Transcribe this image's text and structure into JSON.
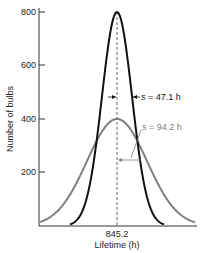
{
  "chart_data": {
    "type": "line",
    "title": "",
    "xlabel": "Lifetime (h)",
    "ylabel": "Number of bulbs",
    "ylim": [
      0,
      800
    ],
    "y_ticks": [
      200,
      400,
      600,
      800
    ],
    "x_ticks": [
      "845.2"
    ],
    "grid": false,
    "mean": 845.2,
    "series": [
      {
        "name": "s = 47.1 h",
        "color": "#111111",
        "mean": 845.2,
        "std": 47.1,
        "peak": 800
      },
      {
        "name": "s = 94.2 h",
        "color": "#808080",
        "mean": 845.2,
        "std": 94.2,
        "peak": 400
      }
    ],
    "annotations": [
      {
        "text_prefix": "s",
        "text_rest": " = 47.1 h",
        "color": "#111111"
      },
      {
        "text_prefix": "s",
        "text_rest": " = 94.2 h",
        "color": "#808080"
      }
    ]
  },
  "labels": {
    "y800": "800",
    "y600": "600",
    "y400": "400",
    "y200": "200",
    "x_center": "845.2",
    "xlabel": "Lifetime (h)",
    "ylabel": "Number of bulbs",
    "s_sym": "s",
    "black_val": " = 47.1 h",
    "gray_val": " = 94.2 h"
  }
}
